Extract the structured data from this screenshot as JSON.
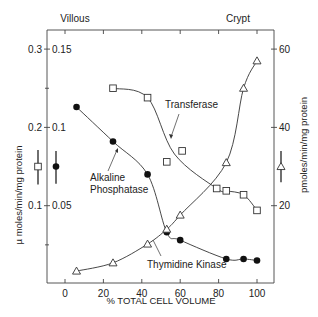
{
  "chart_data": {
    "type": "line",
    "title": "",
    "top_labels": {
      "left": "Villous",
      "right": "Crypt"
    },
    "xlabel": "% TOTAL CELL VOLUME",
    "ylabel_left": "µ moles/min/mg protein",
    "ylabel_right": "pmoles/min/mg protein",
    "xlim": [
      -9,
      109
    ],
    "x_ticks": [
      0,
      20,
      40,
      60,
      80,
      100
    ],
    "x_tick_labels": [
      "0",
      "20",
      "40",
      "60",
      "80",
      "100"
    ],
    "y_left_outer_ticks": [
      0.1,
      0.2,
      0.3
    ],
    "y_left_outer_tick_labels": [
      "0.1",
      "0.2",
      "0.3"
    ],
    "y_left_inner_ticks": [
      0.05,
      0.1,
      0.15
    ],
    "y_left_inner_tick_labels": [
      "0.05",
      "0.1",
      "0.15"
    ],
    "y_left_outer_lim": [
      0,
      0.3
    ],
    "y_left_inner_lim": [
      0,
      0.15
    ],
    "y_right_ticks": [
      20,
      40,
      60
    ],
    "y_right_tick_labels": [
      "20",
      "40",
      "60"
    ],
    "y_right_lim": [
      0,
      60
    ],
    "grid": false,
    "legend": "inline labels",
    "series": [
      {
        "name": "Transferase",
        "marker": "open-square",
        "axis": "left-outer (µ moles/min/mg protein)",
        "x": [
          25,
          43,
          53,
          61,
          79,
          84,
          93,
          100
        ],
        "y": [
          0.25,
          0.238,
          0.156,
          0.17,
          0.122,
          0.119,
          0.114,
          0.094
        ]
      },
      {
        "name": "Alkaline Phosphatase",
        "marker": "filled-circle",
        "axis": "left-inner (µ moles/min/mg protein)",
        "x": [
          6,
          25,
          43,
          53,
          60,
          84,
          93,
          100
        ],
        "y": [
          0.113,
          0.091,
          0.07,
          0.033,
          0.028,
          0.016,
          0.016,
          0.015
        ]
      },
      {
        "name": "Thymidine Kinase",
        "marker": "open-triangle",
        "axis": "right (pmoles/min/mg protein)",
        "x": [
          6,
          25,
          43,
          53,
          60,
          84,
          93,
          100
        ],
        "y": [
          3.3,
          5.4,
          10.2,
          14,
          17.6,
          31,
          50,
          57
        ]
      }
    ],
    "error_bars": [
      {
        "marker": "open-square",
        "side": "left",
        "center": 0.15,
        "low": 0.127,
        "high": 0.171
      },
      {
        "marker": "filled-circle",
        "side": "left",
        "center": 0.075,
        "low": 0.064,
        "high": 0.085
      },
      {
        "marker": "open-triangle",
        "side": "right",
        "center": 30,
        "low": 26,
        "high": 34
      }
    ]
  },
  "annotations": {
    "transferase": "Transferase",
    "alkaline_line1": "Alkaline",
    "alkaline_line2": "Phosphatase",
    "thymidine": "Thymidine Kinase"
  }
}
